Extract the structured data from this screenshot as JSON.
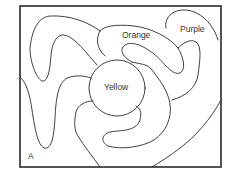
{
  "diagram": {
    "type": "map-coloring-regions",
    "labels": {
      "orange": "Orange",
      "purple": "Purple",
      "yellow": "Yellow",
      "corner": "A"
    },
    "colors": {
      "stroke": "#2a2a2a",
      "background": "#ffffff",
      "text": "#333333"
    }
  }
}
